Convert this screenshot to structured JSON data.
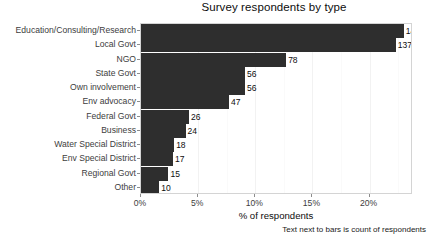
{
  "chart_data": {
    "type": "bar",
    "orientation": "horizontal",
    "title": "Survey respondents by type",
    "xlabel": "% of respondents",
    "ylabel": "",
    "caption": "Text next to bars is count of respondents",
    "xlim": [
      0,
      23.8
    ],
    "xticks": [
      0,
      5,
      10,
      15,
      20
    ],
    "xtick_labels": [
      "0%",
      "5%",
      "10%",
      "15%",
      "20%"
    ],
    "grid": true,
    "legend": "none",
    "bar_color": "#2e2e2e",
    "categories": [
      "Education/Consulting/Research",
      "Local Govt",
      "NGO",
      "State Govt",
      "Own involvement",
      "Env advocacy",
      "Federal Govt",
      "Business",
      "Water Special District",
      "Env Special District",
      "Regional Govt",
      "Other"
    ],
    "values": [
      23.0,
      22.3,
      12.7,
      9.1,
      9.1,
      7.7,
      4.2,
      3.9,
      2.9,
      2.8,
      2.4,
      1.6
    ],
    "counts": [
      141,
      137,
      78,
      56,
      56,
      47,
      26,
      24,
      18,
      17,
      15,
      10
    ],
    "count_labels": [
      "141",
      "137",
      "78",
      "56",
      "56",
      "47",
      "26",
      "24",
      "18",
      "17",
      "15",
      "10"
    ]
  }
}
